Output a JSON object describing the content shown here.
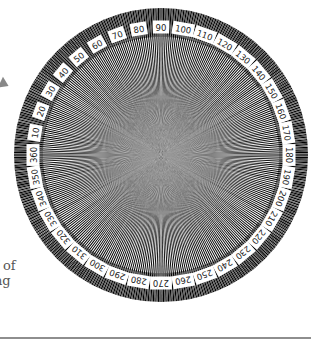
{
  "figure": {
    "center": [
      161,
      155
    ],
    "outer_radius": 147,
    "label_radius": 128,
    "tick_inner_radius": 118,
    "angle_labels": [
      "10",
      "20",
      "30",
      "40",
      "50",
      "60",
      "70",
      "80",
      "90",
      "100",
      "110",
      "120",
      "130",
      "140",
      "150",
      "160",
      "170",
      "180",
      "190",
      "200",
      "210",
      "220",
      "230",
      "240",
      "250",
      "260",
      "270",
      "280",
      "290",
      "300",
      "310",
      "320",
      "330",
      "340",
      "350",
      "360"
    ],
    "label_step_degrees": 10,
    "orientation": "0/360 at left, 90 at top, 180 at right, 270 at bottom (clockwise)",
    "line_color": "#000000",
    "background_color": "#ffffff"
  },
  "side_text": {
    "line1": "f of",
    "line2": "ng"
  },
  "colors": {
    "rule": "#8e8e8e",
    "arrow": "#888888",
    "text": "#555555"
  }
}
